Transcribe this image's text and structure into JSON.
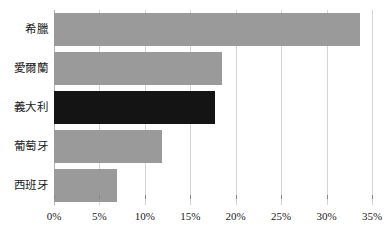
{
  "chart_data": {
    "type": "bar",
    "orientation": "horizontal",
    "title": "",
    "subtitle": "",
    "xlabel": "",
    "ylabel": "",
    "categories": [
      "希臘",
      "愛爾蘭",
      "義大利",
      "葡萄牙",
      "西班牙"
    ],
    "values": [
      33.7,
      18.5,
      17.7,
      11.9,
      6.9
    ],
    "value_labels": [
      "33.7%",
      "18.5%",
      "17.7%",
      "11.9%",
      "6.9%"
    ],
    "xlim": [
      0,
      35
    ],
    "xticks": [
      0,
      5,
      10,
      15,
      20,
      25,
      30,
      35
    ],
    "xtick_labels": [
      "0%",
      "5%",
      "10%",
      "15%",
      "20%",
      "25%",
      "30%",
      "35%"
    ],
    "grid": true,
    "grid_axis": "x",
    "legend": false,
    "legend_position": "none",
    "bar_color": "#9a9a9a",
    "highlight_color": "#141414",
    "highlight_category": "義大利",
    "gridline_color": "#d4d4d4",
    "axis_color": "#b4b4b4",
    "background": "#ffffff",
    "series": [
      {
        "name": "",
        "values": [
          33.7,
          18.5,
          17.7,
          11.9,
          6.9
        ],
        "colors": [
          "#9a9a9a",
          "#9a9a9a",
          "#141414",
          "#9a9a9a",
          "#9a9a9a"
        ]
      }
    ]
  }
}
